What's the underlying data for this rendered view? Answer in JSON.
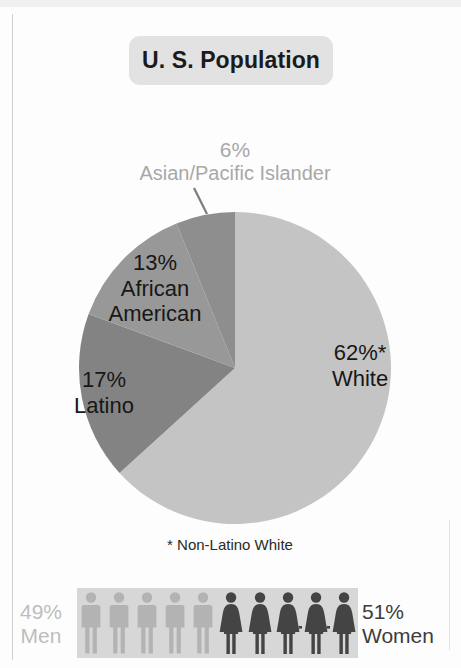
{
  "title": "U. S. Population",
  "footnote": "* Non-Latino White",
  "labels": {
    "asian_pct": "6%",
    "asian_name": "Asian/Pacific Islander",
    "white_pct": "62%*",
    "white_name": "White",
    "aa_pct": "13%",
    "aa_name_1": "African",
    "aa_name_2": "American",
    "latino_pct": "17%",
    "latino_name": "Latino",
    "men_pct": "49%",
    "men_name": "Men",
    "women_pct": "51%",
    "women_name": "Women"
  },
  "colors": {
    "white_slice": "#c4c4c4",
    "latino_slice": "#838383",
    "african_american_slice": "#989898",
    "asian_slice": "#8e8e8e",
    "title_box": "#e2e2e2",
    "band": "#d7d7d7",
    "men_figure": "#b3b3b3",
    "women_figure": "#444444",
    "background": "#fdfdfd"
  },
  "chart_data": {
    "type": "pie",
    "title": "U. S. Population",
    "categories": [
      "White",
      "Latino",
      "African American",
      "Asian/Pacific Islander"
    ],
    "values": [
      62,
      17,
      13,
      6
    ],
    "value_labels": [
      "62%*",
      "17%",
      "13%",
      "6%"
    ],
    "units": "percent",
    "start_angle": 0,
    "direction": "clockwise",
    "slice_colors": [
      "#c4c4c4",
      "#838383",
      "#989898",
      "#8e8e8e"
    ],
    "annotations": [
      "* Non-Latino White"
    ],
    "legend": "none - labels placed on slices",
    "secondary_chart": {
      "type": "pictogram",
      "categories": [
        "Men",
        "Women"
      ],
      "values": [
        49,
        51
      ],
      "value_labels": [
        "49%",
        "51%"
      ],
      "icons_per_category": 5,
      "icon_colors": [
        "#b3b3b3",
        "#444444"
      ]
    }
  }
}
